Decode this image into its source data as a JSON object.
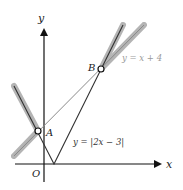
{
  "diagram": {
    "axes": {
      "x_label": "x",
      "y_label": "y",
      "origin_label": "O"
    },
    "points": [
      {
        "name": "A",
        "label": "A"
      },
      {
        "name": "B",
        "label": "B"
      }
    ],
    "curves": [
      {
        "name": "absolute-value",
        "label": "y = |2x − 3|",
        "color": "#333333"
      },
      {
        "name": "line",
        "label": "y = x + 4",
        "color": "#9a9a9a"
      }
    ],
    "highlight_color": "#a0a0a0"
  }
}
